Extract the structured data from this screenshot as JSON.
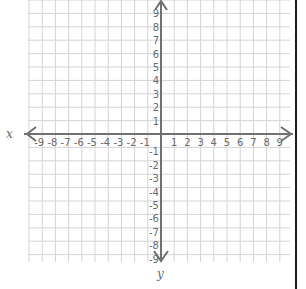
{
  "diagram": {
    "type": "coordinate-plane",
    "x_axis": {
      "label": "x",
      "min": -9,
      "max": 9,
      "tick_labels": [
        "-9",
        "-8",
        "-7",
        "-6",
        "-5",
        "-4",
        "-3",
        "-2",
        "-1",
        "1",
        "2",
        "3",
        "4",
        "5",
        "6",
        "7",
        "8",
        "9"
      ]
    },
    "y_axis": {
      "label": "y",
      "min": -9,
      "max": 9,
      "tick_labels": [
        "9",
        "8",
        "7",
        "6",
        "5",
        "4",
        "3",
        "2",
        "1",
        "-1",
        "-2",
        "-3",
        "-4",
        "-5",
        "-6",
        "-7",
        "-8",
        "-9"
      ]
    },
    "grid": true,
    "colors": {
      "grid": "#d4d4d4",
      "axis": "#707070",
      "labels": "#6a6a6a",
      "border": "#1a1a1a"
    }
  }
}
